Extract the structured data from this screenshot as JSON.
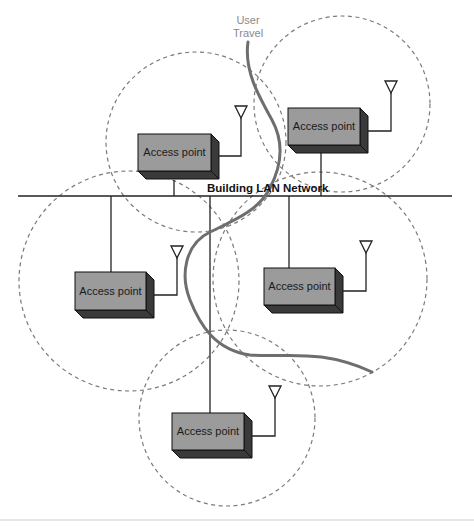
{
  "diagram": {
    "network_label": "Building LAN Network",
    "user_travel_label_line1": "User",
    "user_travel_label_line2": "Travel",
    "access_points": [
      {
        "id": "ap-top-left",
        "label": "Access point"
      },
      {
        "id": "ap-top-right",
        "label": "Access point"
      },
      {
        "id": "ap-middle-left",
        "label": "Access point"
      },
      {
        "id": "ap-middle-right",
        "label": "Access point"
      },
      {
        "id": "ap-bottom",
        "label": "Access point"
      }
    ],
    "coverage_areas_count": 5,
    "icons": {
      "antenna": "antenna-icon",
      "access_point": "access-point-box-icon"
    },
    "colors": {
      "box_front": "#9b9b9b",
      "box_shadow": "#3a3a3a",
      "line": "#222222",
      "coverage_dash": "#7a7a7a",
      "user_path": "#6e6e6e",
      "travel_label": "#8a8a8a"
    }
  }
}
